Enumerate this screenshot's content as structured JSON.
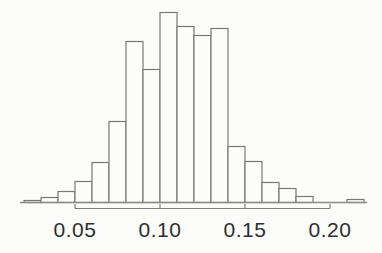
{
  "chart_data": {
    "type": "bar",
    "subtype": "histogram",
    "title": "",
    "xlabel": "",
    "ylabel": "",
    "y_axis_shown": false,
    "grid": false,
    "legend": false,
    "x_ticks": [
      {
        "value": 0.05,
        "label": "0.05"
      },
      {
        "value": 0.1,
        "label": "0.10"
      },
      {
        "value": 0.15,
        "label": "0.15"
      },
      {
        "value": 0.2,
        "label": "0.20"
      }
    ],
    "bin_width": 0.01,
    "bin_left_edges": [
      0.02,
      0.03,
      0.04,
      0.05,
      0.06,
      0.07,
      0.08,
      0.09,
      0.1,
      0.11,
      0.12,
      0.13,
      0.14,
      0.15,
      0.16,
      0.17,
      0.18,
      0.19,
      0.2,
      0.21
    ],
    "heights_rel": [
      2,
      5,
      11,
      21,
      40,
      81,
      161,
      133,
      190,
      176,
      167,
      174,
      56,
      41,
      20,
      14,
      6,
      0,
      0,
      3
    ],
    "x_range_shown": [
      0.02,
      0.22
    ],
    "colors": {
      "bar_outline": "#787878",
      "bar_fill": "#fcfcfb",
      "baseline": "#8a8a8a",
      "axis": "#7d7d7d",
      "text": "#2e2e2e",
      "background": "#fcfcfb"
    }
  }
}
